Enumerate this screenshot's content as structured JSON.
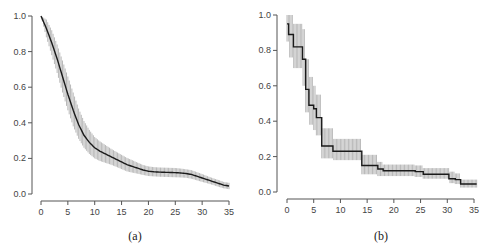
{
  "chart_data": [
    {
      "type": "line",
      "panel": "(a)",
      "title": "",
      "xlabel": "",
      "ylabel": "",
      "caption": "(a)",
      "xlim": [
        0,
        35
      ],
      "ylim": [
        0,
        1.0
      ],
      "x_ticks": [
        "0",
        "5",
        "10",
        "15",
        "20",
        "25",
        "30",
        "35"
      ],
      "y_ticks": [
        "0.0",
        "0.2",
        "0.4",
        "0.6",
        "0.8",
        "1.0"
      ],
      "grid": false,
      "legend": null,
      "style": "smooth curve with vertical confidence bars",
      "x": [
        0,
        1,
        2,
        3,
        4,
        5,
        6,
        7,
        8,
        9,
        10,
        11,
        12,
        13,
        14,
        15,
        16,
        17,
        18,
        19,
        20,
        21,
        22,
        23,
        24,
        25,
        26,
        27,
        28,
        29,
        30,
        31,
        32,
        33,
        34,
        35
      ],
      "series": [
        {
          "name": "estimate",
          "values": [
            1.0,
            0.93,
            0.85,
            0.76,
            0.66,
            0.56,
            0.47,
            0.39,
            0.33,
            0.29,
            0.26,
            0.24,
            0.225,
            0.21,
            0.195,
            0.18,
            0.165,
            0.155,
            0.145,
            0.135,
            0.128,
            0.125,
            0.123,
            0.122,
            0.121,
            0.12,
            0.118,
            0.115,
            0.11,
            0.1,
            0.09,
            0.08,
            0.07,
            0.06,
            0.05,
            0.045
          ]
        },
        {
          "name": "upper",
          "values": [
            1.0,
            0.98,
            0.92,
            0.84,
            0.75,
            0.66,
            0.57,
            0.48,
            0.41,
            0.36,
            0.32,
            0.295,
            0.275,
            0.255,
            0.237,
            0.22,
            0.203,
            0.19,
            0.176,
            0.163,
            0.155,
            0.151,
            0.149,
            0.148,
            0.147,
            0.146,
            0.143,
            0.139,
            0.134,
            0.123,
            0.112,
            0.1,
            0.089,
            0.079,
            0.068,
            0.063
          ]
        },
        {
          "name": "lower",
          "values": [
            1.0,
            0.88,
            0.78,
            0.68,
            0.57,
            0.47,
            0.38,
            0.31,
            0.26,
            0.225,
            0.2,
            0.185,
            0.175,
            0.165,
            0.153,
            0.14,
            0.127,
            0.12,
            0.114,
            0.107,
            0.101,
            0.099,
            0.097,
            0.096,
            0.095,
            0.094,
            0.093,
            0.091,
            0.086,
            0.077,
            0.068,
            0.06,
            0.051,
            0.041,
            0.032,
            0.027
          ]
        }
      ]
    },
    {
      "type": "line",
      "panel": "(b)",
      "title": "",
      "xlabel": "",
      "ylabel": "",
      "caption": "(b)",
      "xlim": [
        0,
        35
      ],
      "ylim": [
        0,
        1.0
      ],
      "x_ticks": [
        "0",
        "5",
        "10",
        "15",
        "20",
        "25",
        "30",
        "35"
      ],
      "y_ticks": [
        "0.0",
        "0.2",
        "0.4",
        "0.6",
        "0.8",
        "1.0"
      ],
      "grid": false,
      "legend": null,
      "style": "step function with vertical confidence bars",
      "x": [
        0,
        0.3,
        1.2,
        2.9,
        3.5,
        4.1,
        5.0,
        5.5,
        6.5,
        8.6,
        14.0,
        17.0,
        18.0,
        24.0,
        25.5,
        30.3,
        31.5,
        32.5,
        35.5
      ],
      "series": [
        {
          "name": "estimate",
          "values": [
            0.95,
            0.89,
            0.82,
            0.75,
            0.58,
            0.49,
            0.47,
            0.42,
            0.26,
            0.23,
            0.15,
            0.13,
            0.12,
            0.115,
            0.1,
            0.075,
            0.07,
            0.045,
            0.045
          ]
        },
        {
          "name": "upper",
          "values": [
            1.0,
            1.0,
            0.95,
            0.92,
            0.75,
            0.65,
            0.6,
            0.55,
            0.36,
            0.3,
            0.21,
            0.17,
            0.155,
            0.15,
            0.135,
            0.115,
            0.105,
            0.07,
            0.07
          ]
        },
        {
          "name": "lower",
          "values": [
            0.85,
            0.76,
            0.7,
            0.6,
            0.45,
            0.38,
            0.35,
            0.32,
            0.19,
            0.18,
            0.1,
            0.09,
            0.09,
            0.085,
            0.075,
            0.05,
            0.045,
            0.025,
            0.025
          ]
        }
      ]
    }
  ]
}
